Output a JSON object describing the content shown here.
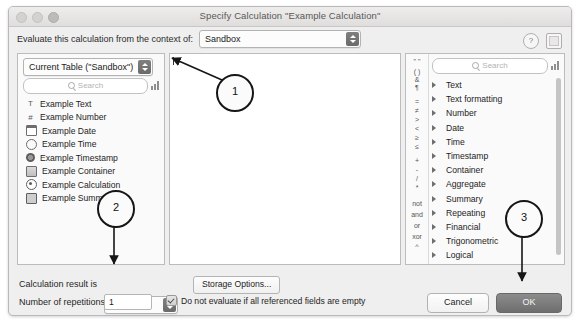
{
  "window": {
    "title": "Specify Calculation \"Example Calculation\"",
    "traffic_lights": [
      "close-button",
      "minimize-button",
      "zoom-button"
    ]
  },
  "context": {
    "label": "Evaluate this calculation from the context of:",
    "value": "Sandbox",
    "help_icon": "?",
    "panel_toggle_icon": "panel-square"
  },
  "fields_pane": {
    "table_popup_value": "Current Table (\"Sandbox\")",
    "search_placeholder": "Search",
    "sort_icon": "bar-chart-icon",
    "items": [
      {
        "label": "Example Text",
        "icon": "text-icon",
        "glyph": "T"
      },
      {
        "label": "Example Number",
        "icon": "number-icon",
        "glyph": "#"
      },
      {
        "label": "Example Date",
        "icon": "calendar-icon",
        "glyph": ""
      },
      {
        "label": "Example Time",
        "icon": "clock-icon",
        "glyph": ""
      },
      {
        "label": "Example Timestamp",
        "icon": "timestamp-icon",
        "glyph": ""
      },
      {
        "label": "Example Container",
        "icon": "container-icon",
        "glyph": ""
      },
      {
        "label": "Example Calculation",
        "icon": "calculation-icon",
        "glyph": ""
      },
      {
        "label": "Example Summary",
        "icon": "summary-icon",
        "glyph": ""
      }
    ]
  },
  "formula_pane": {
    "value": "",
    "caret_visible": true
  },
  "functions_pane": {
    "search_placeholder": "Search",
    "sort_icon": "bar-chart-icon",
    "operators": [
      "\" \"",
      "( )",
      "&",
      "¶",
      "=",
      "≠",
      ">",
      "<",
      "≥",
      "≤",
      "+",
      "-",
      "/",
      "*",
      "not",
      "and",
      "or",
      "xor",
      "^"
    ],
    "categories": [
      "Text",
      "Text formatting",
      "Number",
      "Date",
      "Time",
      "Timestamp",
      "Container",
      "Aggregate",
      "Summary",
      "Repeating",
      "Financial",
      "Trigonometric",
      "Logical",
      "Get",
      "Design"
    ]
  },
  "bottom": {
    "result_label": "Calculation result is",
    "result_value": "Number",
    "storage_button": "Storage Options...",
    "reps_label": "Number of repetitions:",
    "reps_value": "1",
    "checkbox_label": "Do not evaluate if all referenced fields are empty",
    "checkbox_checked": true,
    "cancel_label": "Cancel",
    "ok_label": "OK"
  },
  "annotations": [
    {
      "id": "1",
      "target": "formula-pane"
    },
    {
      "id": "2",
      "target": "calculation-result-popup"
    },
    {
      "id": "3",
      "target": "ok-button"
    }
  ],
  "colors": {
    "window_bg": "#f0efef",
    "pane_bg": "#ffffff",
    "default_button": "#7f7e7e",
    "annotation": "#161616"
  }
}
